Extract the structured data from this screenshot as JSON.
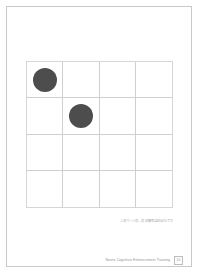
{
  "page": {
    "background_color": "#ffffff",
    "border_color": "#c9c9c9"
  },
  "grid": {
    "rows": 4,
    "columns": 4,
    "line_color": "#cfcfcf",
    "dot_color": "#4d4d4d",
    "caption": "このページの...の正解率は約00%です",
    "cells": [
      {
        "row": 1,
        "col": 1,
        "filled": true
      },
      {
        "row": 1,
        "col": 2,
        "filled": false
      },
      {
        "row": 1,
        "col": 3,
        "filled": false
      },
      {
        "row": 1,
        "col": 4,
        "filled": false
      },
      {
        "row": 2,
        "col": 1,
        "filled": false
      },
      {
        "row": 2,
        "col": 2,
        "filled": true
      },
      {
        "row": 2,
        "col": 3,
        "filled": false
      },
      {
        "row": 2,
        "col": 4,
        "filled": false
      },
      {
        "row": 3,
        "col": 1,
        "filled": false
      },
      {
        "row": 3,
        "col": 2,
        "filled": false
      },
      {
        "row": 3,
        "col": 3,
        "filled": false
      },
      {
        "row": 3,
        "col": 4,
        "filled": false
      },
      {
        "row": 4,
        "col": 1,
        "filled": false
      },
      {
        "row": 4,
        "col": 2,
        "filled": false
      },
      {
        "row": 4,
        "col": 3,
        "filled": false
      },
      {
        "row": 4,
        "col": 4,
        "filled": false
      }
    ]
  },
  "footer": {
    "label": "Neuro Cognitive Enhancement Training",
    "page_number": "10"
  }
}
